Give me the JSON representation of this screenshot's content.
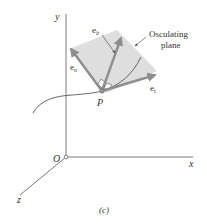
{
  "figure": {
    "caption": "(c)",
    "axes": {
      "x_label": "x",
      "y_label": "y",
      "z_label": "z",
      "origin_label": "O"
    },
    "point_label": "P",
    "vectors": [
      {
        "id": "tangent",
        "label": "e",
        "subscript": "t"
      },
      {
        "id": "normal",
        "label": "e",
        "subscript": "n"
      },
      {
        "id": "binormal",
        "label": "e",
        "subscript": "b"
      }
    ],
    "plane_annotation": {
      "line1": "Osculating",
      "line2": "plane"
    },
    "colors": {
      "plane_fill": "#dedede",
      "vector": "#8e8e8e",
      "axis": "#7a7a7a",
      "curve": "#555555",
      "text": "#333333"
    }
  }
}
